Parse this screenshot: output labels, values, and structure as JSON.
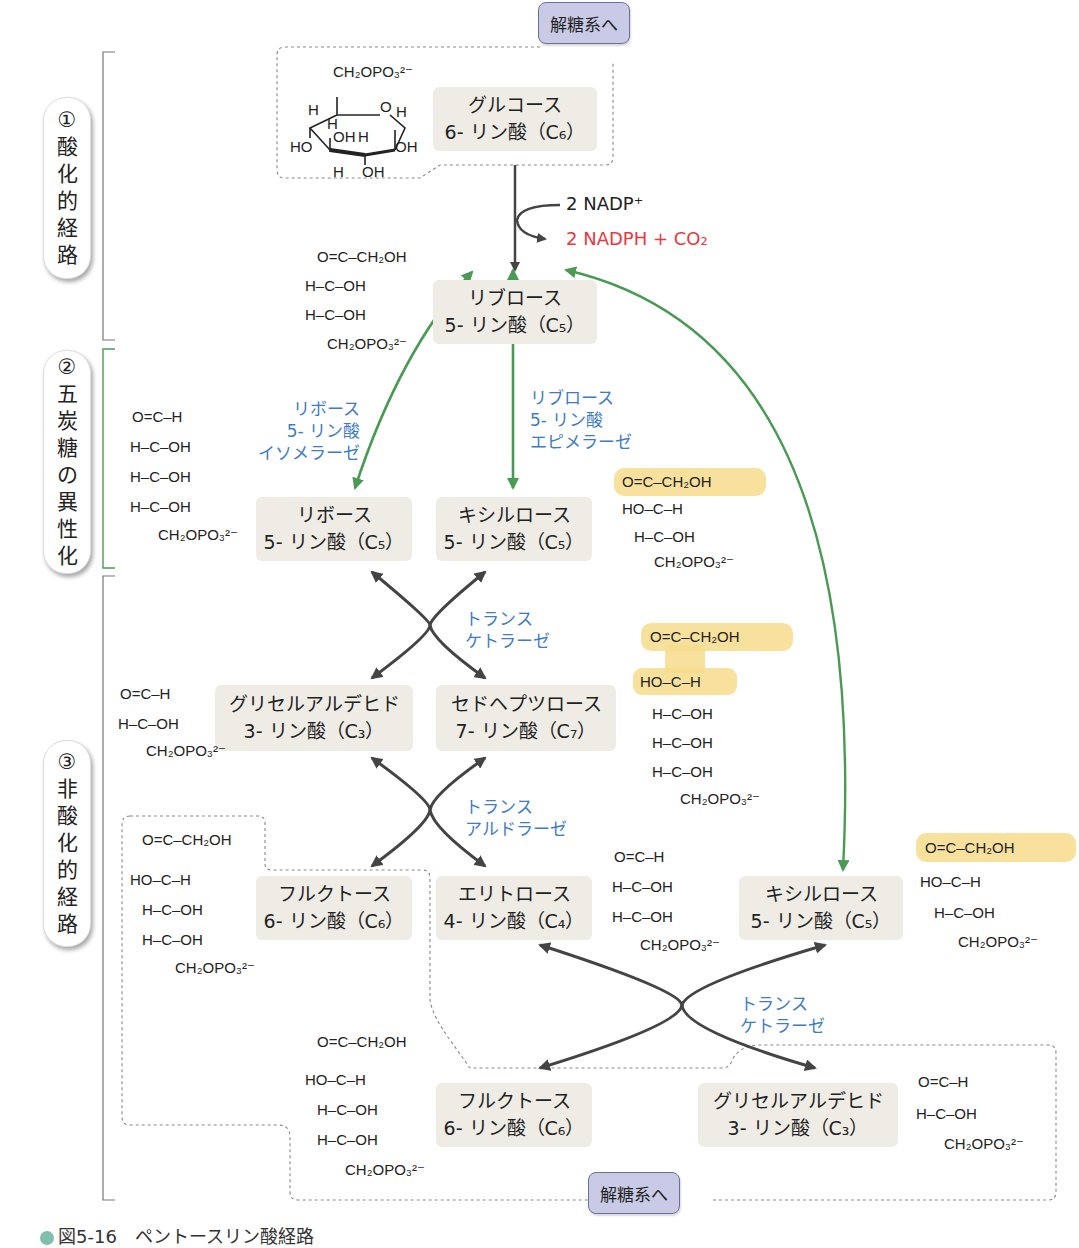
{
  "figure": {
    "caption": "図5-16　ペントースリン酸経路",
    "colors": {
      "box_bg": "#efece6",
      "enzyme_text": "#3f7cc4",
      "isomerization_arrow": "#4a9a55",
      "reaction_arrow": "#444444",
      "product_highlight": "#e8373e",
      "transfer_highlight": "#f7dc8c",
      "glycolysis_tag_bg": "#c9cbe6",
      "bracket_phase2": "#4a9a55"
    }
  },
  "phases": [
    {
      "num": "①",
      "chars": [
        "酸",
        "化",
        "的",
        "経",
        "路"
      ],
      "label": "酸化的経路"
    },
    {
      "num": "②",
      "chars": [
        "五",
        "炭",
        "糖",
        "の",
        "異",
        "性",
        "化"
      ],
      "label": "五炭糖の異性化"
    },
    {
      "num": "③",
      "chars": [
        "非",
        "酸",
        "化",
        "的",
        "経",
        "路"
      ],
      "label": "非酸化的経路"
    }
  ],
  "tags": {
    "to_glycolysis_top": "解糖系へ",
    "to_glycolysis_bottom": "解糖系へ"
  },
  "cofactors": {
    "input": "2 NADP⁺",
    "output": "2 NADPH + CO₂"
  },
  "compounds": {
    "g6p": {
      "name": "グルコース",
      "line2": "6- リン酸（C₆）"
    },
    "ru5p": {
      "name": "リブロース",
      "line2": "5- リン酸（C₅）"
    },
    "r5p": {
      "name": "リボース",
      "line2": "5- リン酸（C₅）"
    },
    "xu5p_a": {
      "name": "キシルロース",
      "line2": "5- リン酸（C₅）"
    },
    "gap_a": {
      "name": "グリセルアルデヒド",
      "line2": "3- リン酸（C₃）"
    },
    "s7p": {
      "name": "セドヘプツロース",
      "line2": "7- リン酸（C₇）"
    },
    "f6p_a": {
      "name": "フルクトース",
      "line2": "6- リン酸（C₆）"
    },
    "e4p": {
      "name": "エリトロース",
      "line2": "4- リン酸（C₄）"
    },
    "xu5p_b": {
      "name": "キシルロース",
      "line2": "5- リン酸（C₅）"
    },
    "f6p_b": {
      "name": "フルクトース",
      "line2": "6- リン酸（C₆）"
    },
    "gap_b": {
      "name": "グリセルアルデヒド",
      "line2": "3- リン酸（C₃）"
    }
  },
  "enzymes": {
    "r5p_isomerase": [
      "リボース",
      "5- リン酸",
      "イソメラーゼ"
    ],
    "ru5p_epimerase": [
      "リブロース",
      "5- リン酸",
      "エピメラーゼ"
    ],
    "transketolase_1": [
      "トランス",
      "ケトラーゼ"
    ],
    "transaldolase": [
      "トランス",
      "アルドラーゼ"
    ],
    "transketolase_2": [
      "トランス",
      "ケトラーゼ"
    ]
  },
  "structures": {
    "glucose6p_ring": {
      "top": "CH₂OPO₃²⁻",
      "labels": [
        "H",
        "O",
        "H",
        "H",
        "HO",
        "OH",
        "H",
        "OH",
        "H",
        "OH"
      ]
    },
    "ribulose5p": [
      "O=C–CH₂OH",
      "H–C–OH",
      "H–C–OH",
      "CH₂OPO₃²⁻"
    ],
    "ribose5p": [
      "O=C–H",
      "H–C–OH",
      "H–C–OH",
      "H–C–OH",
      "CH₂OPO₃²⁻"
    ],
    "xylulose5p": [
      "O=C–CH₂OH",
      "HO–C–H",
      "H–C–OH",
      "CH₂OPO₃²⁻"
    ],
    "glyceraldehyde3p": [
      "O=C–H",
      "H–C–OH",
      "CH₂OPO₃²⁻"
    ],
    "sedoheptulose7p": [
      "O=C–CH₂OH",
      "HO–C–H",
      "H–C–OH",
      "H–C–OH",
      "H–C–OH",
      "CH₂OPO₃²⁻"
    ],
    "fructose6p": [
      "O=C–CH₂OH",
      "HO–C–H",
      "H–C–OH",
      "H–C–OH",
      "CH₂OPO₃²⁻"
    ],
    "erythrose4p": [
      "O=C–H",
      "H–C–OH",
      "H–C–OH",
      "CH₂OPO₃²⁻"
    ]
  },
  "chem_text": {
    "p": "CH₂OPO₃²⁻",
    "ch2oh": "CH₂OH",
    "o": "O",
    "c": "C",
    "h": "H",
    "oh": "OH",
    "ho": "HO",
    "hcoh": "H–C–OH",
    "hoch": "HO–C–H"
  }
}
